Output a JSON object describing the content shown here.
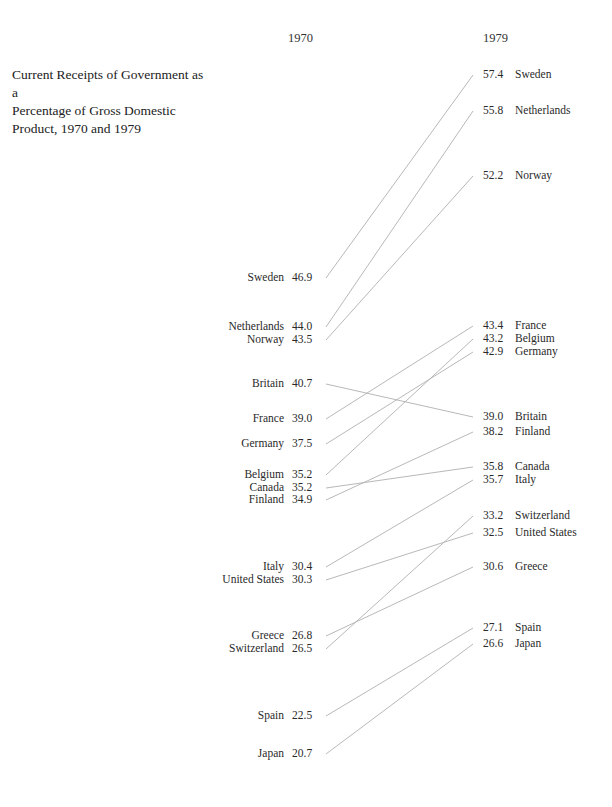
{
  "chart_data": {
    "type": "slope",
    "title": "Current Receipts of Government as a Percentage of Gross Domestic Product, 1970 and 1979",
    "xlabel": "",
    "ylabel": "",
    "categories": [
      "1970",
      "1979"
    ],
    "grid": false,
    "legend": "none",
    "series": [
      {
        "name": "Sweden",
        "values": [
          46.9,
          57.4
        ]
      },
      {
        "name": "Netherlands",
        "values": [
          44.0,
          55.8
        ]
      },
      {
        "name": "Norway",
        "values": [
          43.5,
          52.2
        ]
      },
      {
        "name": "Britain",
        "values": [
          40.7,
          39.0
        ]
      },
      {
        "name": "France",
        "values": [
          39.0,
          43.4
        ]
      },
      {
        "name": "Germany",
        "values": [
          37.5,
          42.9
        ]
      },
      {
        "name": "Belgium",
        "values": [
          35.2,
          43.2
        ]
      },
      {
        "name": "Canada",
        "values": [
          35.2,
          35.8
        ]
      },
      {
        "name": "Finland",
        "values": [
          34.9,
          38.2
        ]
      },
      {
        "name": "Italy",
        "values": [
          30.4,
          35.7
        ]
      },
      {
        "name": "United States",
        "values": [
          30.3,
          32.5
        ]
      },
      {
        "name": "Greece",
        "values": [
          26.8,
          30.6
        ]
      },
      {
        "name": "Switzerland",
        "values": [
          26.5,
          33.2
        ]
      },
      {
        "name": "Spain",
        "values": [
          22.5,
          27.1
        ]
      },
      {
        "name": "Japan",
        "values": [
          20.7,
          26.6
        ]
      }
    ]
  },
  "header": {
    "title_lines": [
      "Current Receipts of Government as a",
      "Percentage of Gross Domestic",
      "Product, 1970 and 1979"
    ],
    "year_left": "1970",
    "year_right": "1979"
  },
  "left": [
    {
      "name": "Sweden",
      "value": "46.9",
      "y": 278
    },
    {
      "name": "Netherlands",
      "value": "44.0",
      "y": 327
    },
    {
      "name": "Norway",
      "value": "43.5",
      "y": 340
    },
    {
      "name": "Britain",
      "value": "40.7",
      "y": 384
    },
    {
      "name": "France",
      "value": "39.0",
      "y": 419
    },
    {
      "name": "Germany",
      "value": "37.5",
      "y": 444
    },
    {
      "name": "Belgium",
      "value": "35.2",
      "y": 475
    },
    {
      "name": "Canada",
      "value": "35.2",
      "y": 488
    },
    {
      "name": "Finland",
      "value": "34.9",
      "y": 500
    },
    {
      "name": "Italy",
      "value": "30.4",
      "y": 567
    },
    {
      "name": "United States",
      "value": "30.3",
      "y": 580
    },
    {
      "name": "Greece",
      "value": "26.8",
      "y": 636
    },
    {
      "name": "Switzerland",
      "value": "26.5",
      "y": 649
    },
    {
      "name": "Spain",
      "value": "22.5",
      "y": 716
    },
    {
      "name": "Japan",
      "value": "20.7",
      "y": 754
    }
  ],
  "right": [
    {
      "name": "Sweden",
      "value": "57.4",
      "y": 75
    },
    {
      "name": "Netherlands",
      "value": "55.8",
      "y": 111
    },
    {
      "name": "Norway",
      "value": "52.2",
      "y": 176
    },
    {
      "name": "France",
      "value": "43.4",
      "y": 326
    },
    {
      "name": "Belgium",
      "value": "43.2",
      "y": 339
    },
    {
      "name": "Germany",
      "value": "42.9",
      "y": 352
    },
    {
      "name": "Britain",
      "value": "39.0",
      "y": 417
    },
    {
      "name": "Finland",
      "value": "38.2",
      "y": 432
    },
    {
      "name": "Canada",
      "value": "35.8",
      "y": 467
    },
    {
      "name": "Italy",
      "value": "35.7",
      "y": 480
    },
    {
      "name": "Switzerland",
      "value": "33.2",
      "y": 516
    },
    {
      "name": "United States",
      "value": "32.5",
      "y": 533
    },
    {
      "name": "Greece",
      "value": "30.6",
      "y": 567
    },
    {
      "name": "Spain",
      "value": "27.1",
      "y": 628
    },
    {
      "name": "Japan",
      "value": "26.6",
      "y": 644
    }
  ],
  "colors": {
    "line": "#b0b0b0",
    "text": "#2a2a2a"
  }
}
